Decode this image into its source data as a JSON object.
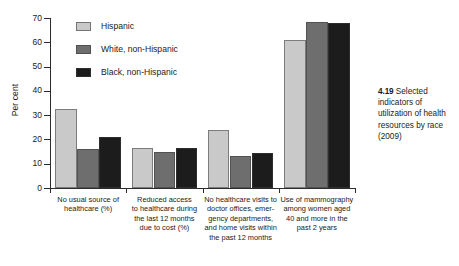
{
  "figure": {
    "caption_number": "4.19",
    "caption_text": "Selected indicators of utilization of health resources by race (2009)"
  },
  "axis": {
    "y_title": "Per cent",
    "y_ticks": [
      "0",
      "10",
      "20",
      "30",
      "40",
      "50",
      "60",
      "70"
    ]
  },
  "legend": {
    "items": [
      {
        "label": "Hispanic",
        "color": "#c9c9c9"
      },
      {
        "label": "White, non-Hispanic",
        "color": "#6e6e6e"
      },
      {
        "label": "Black, non-Hispanic",
        "color": "#1c1c1c"
      }
    ]
  },
  "chart_data": {
    "type": "bar",
    "title": "Selected indicators of utilization of health resources by race (2009)",
    "xlabel": "",
    "ylabel": "Per cent",
    "ylim": [
      0,
      70
    ],
    "yticks": [
      0,
      10,
      20,
      30,
      40,
      50,
      60,
      70
    ],
    "grid": false,
    "legend_position": "top-left-inside",
    "categories": [
      "No usual source of healthcare (%)",
      "Reduced access to healthcare during the last 12 months due to cost (%)",
      "No healthcare visits to doctor offices, emergency departments, and home visits within the past 12 months",
      "Use of mammography among women aged 40 and more in the past 2 years"
    ],
    "category_lines": [
      [
        "No usual source of",
        "healthcare (%)"
      ],
      [
        "Reduced access",
        "to healthcare during",
        "the last 12 months",
        "due to cost (%)"
      ],
      [
        "No healthcare visits to",
        "doctor offices, emer-",
        "gency departments,",
        "and home visits within",
        "the past 12 months"
      ],
      [
        "Use of mammography",
        "among women aged",
        "40 and more in the",
        "past 2 years"
      ]
    ],
    "series": [
      {
        "name": "Hispanic",
        "color": "#c9c9c9",
        "values": [
          32.5,
          16.5,
          24.0,
          61.0
        ]
      },
      {
        "name": "White, non-Hispanic",
        "color": "#6e6e6e",
        "values": [
          16.0,
          15.0,
          13.0,
          68.5
        ]
      },
      {
        "name": "Black, non-Hispanic",
        "color": "#1c1c1c",
        "values": [
          21.0,
          16.5,
          14.5,
          68.0
        ]
      }
    ]
  }
}
